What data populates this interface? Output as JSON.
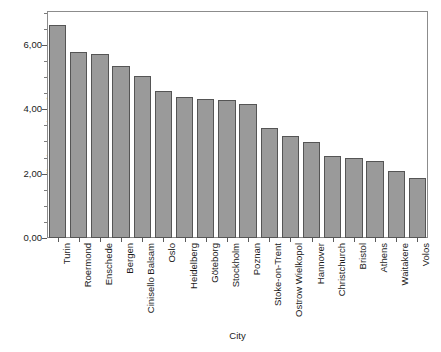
{
  "chart_data": {
    "type": "bar",
    "title": "",
    "xlabel": "City",
    "ylabel": "Effective number of parties",
    "ylim": [
      0,
      7.05
    ],
    "ytick_values": [
      0,
      2,
      4,
      6
    ],
    "ytick_labels": [
      "0,00",
      "2,00",
      "4,00",
      "6,00"
    ],
    "minor_tick_step": 0.5,
    "grid": false,
    "legend": null,
    "bar_color": "#9a9a9a",
    "bar_edge_color": "#555555",
    "frame_color": "#8c8c8c",
    "categories": [
      "Turin",
      "Roermond",
      "Enschede",
      "Bergen",
      "Cinisello Balsam",
      "Oslo",
      "Heidelberg",
      "Göteborg",
      "Stockholm",
      "Poznan",
      "Stoke-on-Trent",
      "Ostrow Wielkopol",
      "Hannover",
      "Christchurch",
      "Bristol",
      "Athens",
      "Waitakere",
      "Volos"
    ],
    "values": [
      6.62,
      5.78,
      5.71,
      5.33,
      5.03,
      4.58,
      4.38,
      4.33,
      4.3,
      4.17,
      3.43,
      3.17,
      2.97,
      2.56,
      2.48,
      2.38,
      2.07,
      1.87
    ]
  },
  "axis": {
    "y_title": "Effective number of parties",
    "x_title": "City"
  }
}
